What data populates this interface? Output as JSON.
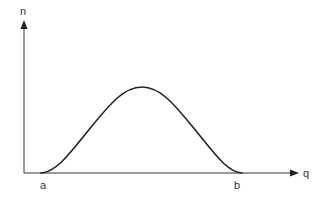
{
  "diagram": {
    "type": "function-curve",
    "y_axis_label": "n",
    "x_axis_label": "q",
    "x_markers": [
      "a",
      "b"
    ],
    "colors": {
      "axis": "#333333",
      "curve": "#222222",
      "background": "#ffffff"
    }
  }
}
